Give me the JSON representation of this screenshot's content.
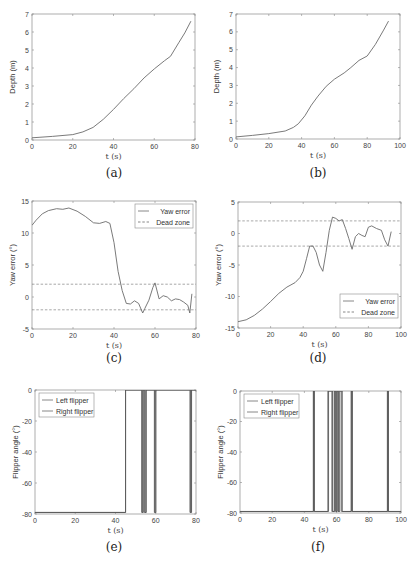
{
  "captions": [
    "(a)",
    "(b)",
    "(c)",
    "(d)",
    "(e)",
    "(f)"
  ],
  "chart_data": [
    {
      "id": "a",
      "type": "line",
      "title": "",
      "xlabel": "t (s)",
      "ylabel": "Depth (m)",
      "xlim": [
        0,
        80
      ],
      "ylim": [
        0,
        7
      ],
      "xticks": [
        0,
        20,
        40,
        60,
        80
      ],
      "yticks": [
        0,
        1,
        2,
        3,
        4,
        5,
        6,
        7
      ],
      "grid": false,
      "series": [
        {
          "name": "Depth",
          "x": [
            0,
            10,
            20,
            25,
            30,
            35,
            40,
            45,
            50,
            55,
            60,
            65,
            68,
            72,
            75,
            78
          ],
          "y": [
            0.12,
            0.2,
            0.3,
            0.45,
            0.7,
            1.15,
            1.7,
            2.3,
            2.85,
            3.45,
            3.95,
            4.4,
            4.65,
            5.4,
            5.95,
            6.6
          ]
        }
      ]
    },
    {
      "id": "b",
      "type": "line",
      "title": "",
      "xlabel": "t (s)",
      "ylabel": "Depth (m)",
      "xlim": [
        0,
        100
      ],
      "ylim": [
        0,
        7
      ],
      "xticks": [
        0,
        20,
        40,
        60,
        80,
        100
      ],
      "yticks": [
        0,
        1,
        2,
        3,
        4,
        5,
        6,
        7
      ],
      "grid": false,
      "series": [
        {
          "name": "Depth",
          "x": [
            0,
            10,
            20,
            30,
            35,
            38,
            42,
            46,
            50,
            55,
            60,
            66,
            70,
            75,
            80,
            85,
            90,
            93
          ],
          "y": [
            0.12,
            0.2,
            0.3,
            0.45,
            0.65,
            0.85,
            1.3,
            1.9,
            2.4,
            2.95,
            3.35,
            3.7,
            4.0,
            4.4,
            4.65,
            5.3,
            6.1,
            6.6
          ]
        }
      ]
    },
    {
      "id": "c",
      "type": "line",
      "title": "",
      "xlabel": "t (s)",
      "ylabel": "Yaw error (°)",
      "xlim": [
        0,
        80
      ],
      "ylim": [
        -5,
        15
      ],
      "xticks": [
        0,
        20,
        40,
        60,
        80
      ],
      "yticks": [
        -5,
        0,
        5,
        10,
        15
      ],
      "grid": false,
      "legend": {
        "position": "upper right",
        "entries": [
          "Yaw error",
          "Dead zone"
        ]
      },
      "series": [
        {
          "name": "Yaw error",
          "style": "solid",
          "x": [
            0,
            2,
            5,
            8,
            12,
            15,
            18,
            22,
            26,
            30,
            33,
            36,
            38,
            40,
            42,
            44,
            46,
            48,
            50,
            52,
            54,
            55,
            57,
            59,
            60,
            62,
            64,
            66,
            68,
            70,
            72,
            74,
            76,
            77,
            78
          ],
          "y": [
            11.2,
            12.0,
            13.0,
            13.5,
            13.8,
            13.7,
            13.9,
            13.4,
            12.6,
            11.6,
            11.5,
            11.8,
            11.5,
            8.5,
            4.0,
            1.0,
            -1.0,
            -1.1,
            -0.6,
            -1.0,
            -2.5,
            -1.8,
            -0.5,
            1.5,
            2.2,
            -0.3,
            0.2,
            0.0,
            -0.6,
            -0.3,
            -0.4,
            -0.8,
            -1.3,
            -2.5,
            0.5
          ]
        },
        {
          "name": "Dead zone",
          "style": "dashed",
          "segments": [
            {
              "x": [
                0,
                80
              ],
              "y": [
                2,
                2
              ]
            },
            {
              "x": [
                0,
                80
              ],
              "y": [
                -2,
                -2
              ]
            }
          ]
        }
      ]
    },
    {
      "id": "d",
      "type": "line",
      "title": "",
      "xlabel": "t (s)",
      "ylabel": "Yaw error (°)",
      "xlim": [
        0,
        100
      ],
      "ylim": [
        -15,
        5
      ],
      "xticks": [
        0,
        20,
        40,
        60,
        80,
        100
      ],
      "yticks": [
        -15,
        -10,
        -5,
        0,
        5
      ],
      "grid": false,
      "legend": {
        "position": "lower right",
        "entries": [
          "Yaw error",
          "Dead zone"
        ]
      },
      "series": [
        {
          "name": "Yaw error",
          "style": "solid",
          "x": [
            0,
            5,
            10,
            15,
            20,
            25,
            30,
            35,
            38,
            40,
            42,
            44,
            46,
            48,
            50,
            52,
            54,
            56,
            58,
            60,
            62,
            64,
            66,
            68,
            70,
            72,
            74,
            76,
            78,
            80,
            82,
            85,
            88,
            90,
            92,
            94
          ],
          "y": [
            -14.0,
            -13.7,
            -13.0,
            -12.0,
            -10.8,
            -9.5,
            -8.5,
            -7.8,
            -7.0,
            -6.0,
            -4.0,
            -2.0,
            -2.0,
            -3.0,
            -5.0,
            -6.0,
            -3.0,
            0.5,
            2.6,
            2.4,
            2.0,
            2.2,
            0.8,
            -0.8,
            -2.5,
            -0.5,
            0.0,
            -0.3,
            -0.5,
            1.0,
            1.2,
            0.8,
            0.5,
            -1.0,
            -2.0,
            0.3
          ]
        },
        {
          "name": "Dead zone",
          "style": "dashed",
          "segments": [
            {
              "x": [
                0,
                100
              ],
              "y": [
                2,
                2
              ]
            },
            {
              "x": [
                0,
                100
              ],
              "y": [
                -2,
                -2
              ]
            }
          ]
        }
      ]
    },
    {
      "id": "e",
      "type": "line",
      "title": "",
      "xlabel": "t (s)",
      "ylabel": "Flipper angle (°)",
      "xlim": [
        0,
        80
      ],
      "ylim": [
        -80,
        0
      ],
      "xticks": [
        0,
        20,
        40,
        60,
        80
      ],
      "yticks": [
        -80,
        -60,
        -40,
        -20,
        0
      ],
      "grid": false,
      "legend": {
        "position": "upper left",
        "entries": [
          "Left flipper",
          "Right flipper"
        ]
      },
      "series": [
        {
          "name": "Left flipper",
          "switch_times": [
            45,
            53,
            53.5,
            54.3,
            55,
            59.3,
            59.8,
            77,
            77.6
          ],
          "levels": [
            -79,
            0
          ]
        },
        {
          "name": "Right flipper",
          "switch_times": [
            45,
            53.2,
            53.8,
            54.6,
            55.3,
            59.5,
            60.1,
            77.2,
            77.8
          ],
          "levels": [
            -79,
            0
          ]
        }
      ]
    },
    {
      "id": "f",
      "type": "line",
      "title": "",
      "xlabel": "t (s)",
      "ylabel": "Flipper angle (°)",
      "xlim": [
        0,
        100
      ],
      "ylim": [
        -80,
        0
      ],
      "xticks": [
        0,
        20,
        40,
        60,
        80,
        100
      ],
      "yticks": [
        -80,
        -60,
        -40,
        -20,
        0
      ],
      "grid": false,
      "legend": {
        "position": "upper left",
        "entries": [
          "Left flipper",
          "Right flipper"
        ]
      },
      "series": [
        {
          "name": "Left flipper",
          "switch_times": [
            45.5,
            46,
            54.5,
            57,
            58.5,
            59.3,
            60,
            60.8,
            61.5,
            63,
            69,
            69.6,
            91.5,
            92
          ],
          "levels": [
            -79,
            0
          ]
        },
        {
          "name": "Right flipper",
          "switch_times": [
            45.7,
            46.2,
            55,
            57.5,
            58.8,
            59.6,
            60.3,
            61.1,
            62,
            63.5,
            69.2,
            69.8,
            91.7,
            92.2
          ],
          "levels": [
            -79,
            0
          ]
        }
      ]
    }
  ]
}
